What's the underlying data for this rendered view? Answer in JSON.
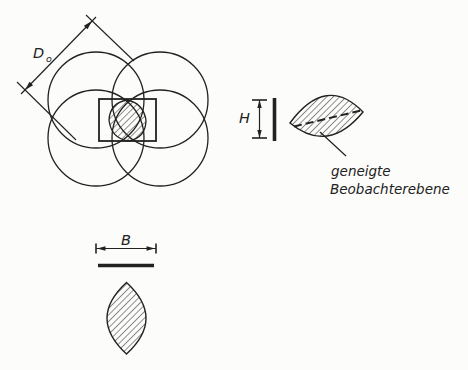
{
  "colors": {
    "ink": "#222222",
    "paper": "#fcfcfb"
  },
  "labels": {
    "coverage_diameter": "D",
    "coverage_diameter_sub": "o",
    "model_height": "H",
    "base_length": "B"
  },
  "annotation": {
    "line1": "geneigte",
    "line2": "Beobachterebene"
  }
}
